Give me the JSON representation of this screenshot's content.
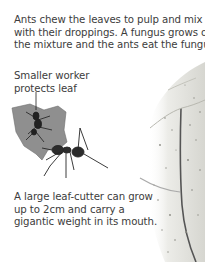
{
  "captions": {
    "top": {
      "lines": [
        "Ants chew the leaves to pulp and mix it -",
        "with their droppings. A fungus grows on",
        "the mixture and the ants eat the fungus."
      ]
    },
    "worker": {
      "lines": [
        "Smaller worker",
        "protects leaf"
      ]
    },
    "bottom": {
      "lines": [
        "A large leaf-cutter can grow",
        "up to 2cm and carry a",
        "gigantic weight in its mouth."
      ]
    }
  },
  "illustrations": {
    "ant_with_leaf": "leaf-cutter ant carrying leaf fragment with small worker on top",
    "large_leaf": "textured green-grey leaf edge on right side"
  },
  "colors": {
    "text": "#3c3c3c",
    "leaf_fragment": "#8f8f8f",
    "big_leaf": "#e2e2dc",
    "ant": "#2a2a2a"
  }
}
